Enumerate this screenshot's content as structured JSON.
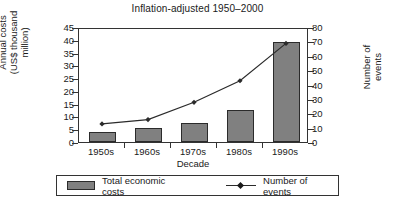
{
  "chart_data": {
    "type": "bar",
    "title": "Inflation-adjusted 1950–2000",
    "xlabel": "Decade",
    "categories": [
      "1950s",
      "1960s",
      "1970s",
      "1980s",
      "1990s"
    ],
    "grid": false,
    "legend_position": "bottom",
    "series": [
      {
        "name": "Total economic costs",
        "type": "bar",
        "axis": "left",
        "color": "#808080",
        "values": [
          4,
          5.5,
          7.5,
          12.5,
          39
        ]
      },
      {
        "name": "Number of events",
        "type": "line",
        "axis": "right",
        "color": "#2b2b2b",
        "marker": "diamond",
        "values": [
          14,
          17,
          29,
          44,
          70
        ]
      }
    ],
    "y_left": {
      "label": "Annual costs (US$ thousand million)",
      "label_line1": "Annual costs",
      "label_line2": "(US$ thousand",
      "label_line3": "million)",
      "ylim": [
        0,
        45
      ],
      "ticks": [
        45,
        40,
        35,
        30,
        25,
        20,
        15,
        10,
        5,
        0
      ]
    },
    "y_right": {
      "label": "Number of events",
      "label_line1": "Number of",
      "label_line2": "events",
      "ylim": [
        0,
        80
      ],
      "ticks": [
        80,
        70,
        60,
        50,
        40,
        30,
        20,
        10,
        0
      ]
    }
  },
  "legend": {
    "bars_label": "Total economic costs",
    "line_label": "Number of events"
  }
}
